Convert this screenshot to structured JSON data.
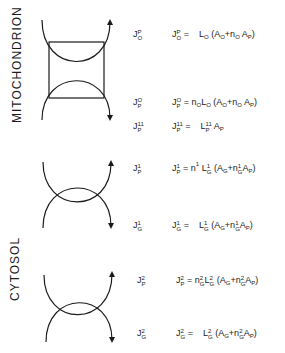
{
  "labels": {
    "mitochondrion": "MITOCHONDRION",
    "cytosol": "CYTOSOL"
  },
  "fluxes": [
    {
      "id": "JOP",
      "symbol": "J",
      "sup": "P",
      "sub": "O",
      "equation": {
        "lhs_sup": "P",
        "lhs_sub": "O",
        "rhs": "L O (A O + n O A P)"
      }
    },
    {
      "id": "JPO",
      "symbol": "J",
      "sup": "O",
      "sub": "P",
      "equation": {
        "lhs_sup": "O",
        "lhs_sub": "P",
        "rhs": "n O L O (A O + n O A P)"
      }
    },
    {
      "id": "JP11",
      "symbol": "J",
      "sup": "11",
      "sub": "P",
      "equation": {
        "lhs_sup": "11",
        "lhs_sub": "P",
        "rhs": "L P 11 A P"
      }
    },
    {
      "id": "JP1",
      "symbol": "J",
      "sup": "1",
      "sub": "P",
      "equation": {
        "lhs_sup": "1",
        "lhs_sub": "P",
        "rhs": "n 1 L G 1 (A G + n G 1 A P)"
      }
    },
    {
      "id": "JG1",
      "symbol": "J",
      "sup": "1",
      "sub": "G",
      "equation": {
        "lhs_sup": "1",
        "lhs_sub": "G",
        "rhs": "L G 1 (A G + n G 1 A P)"
      }
    },
    {
      "id": "JP2",
      "symbol": "J",
      "sup": "2",
      "sub": "P",
      "equation": {
        "lhs_sup": "2",
        "lhs_sub": "P",
        "rhs": "n G 2 L G 2 (A G + n G 2 A P)"
      }
    },
    {
      "id": "JG2",
      "symbol": "J",
      "sup": "2",
      "sub": "G",
      "equation": {
        "lhs_sup": "2",
        "lhs_sub": "G",
        "rhs": "L G 2 (A G + n G 2 A P)"
      }
    }
  ],
  "tokens": {
    "J": "J",
    "eq": "=",
    "L": "L",
    "A": "A",
    "n": "n",
    "open": "(",
    "close": ")",
    "plus": "+",
    "O": "O",
    "P": "P",
    "G": "G",
    "one": "1",
    "two": "2",
    "eleven": "11"
  },
  "colors": {
    "ink": "#1a1a1a",
    "background": "#ffffff"
  }
}
